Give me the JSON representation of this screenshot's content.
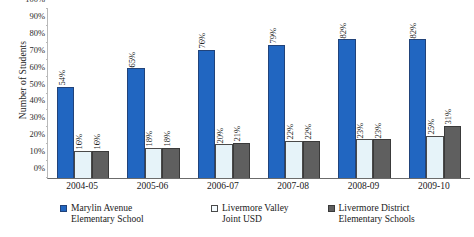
{
  "chart_data": {
    "type": "bar",
    "title": "",
    "xlabel": "",
    "ylabel": "Number of Students",
    "ylim": [
      0,
      100
    ],
    "yticks": [
      "0%",
      "10%",
      "20%",
      "30%",
      "40%",
      "50%",
      "60%",
      "70%",
      "80%",
      "90%",
      "100%"
    ],
    "ytick_values": [
      0,
      10,
      20,
      30,
      40,
      50,
      60,
      70,
      80,
      90,
      100
    ],
    "grid": false,
    "legend_position": "bottom",
    "categories": [
      "2004-05",
      "2005-06",
      "2006-07",
      "2007-08",
      "2008-09",
      "2009-10"
    ],
    "series": [
      {
        "name": "Marylin Avenue Elementary School",
        "color": "#2166c1",
        "values": [
          54,
          65,
          76,
          79,
          82,
          82
        ],
        "labels": [
          "54%",
          "65%",
          "76%",
          "79%",
          "82%",
          "82%"
        ]
      },
      {
        "name": "Livermore Valley Joint USD",
        "color": "#e6f3f9",
        "values": [
          16,
          18,
          20,
          22,
          23,
          25
        ],
        "labels": [
          "16%",
          "18%",
          "20%",
          "22%",
          "23%",
          "25%"
        ]
      },
      {
        "name": "Livermore District Elementary Schools",
        "color": "#5f5f5f",
        "values": [
          16,
          18,
          21,
          22,
          23,
          31
        ],
        "labels": [
          "16%",
          "18%",
          "21%",
          "22%",
          "23%",
          "31%"
        ]
      }
    ]
  },
  "legend": {
    "items": [
      {
        "label": "Marylin Avenue\nElementary School",
        "color": "#2166c1"
      },
      {
        "label": "Livermore Valley\nJoint USD",
        "color": "#f4fbfe"
      },
      {
        "label": "Livermore District\nElementary Schools",
        "color": "#5f5f5f"
      }
    ]
  }
}
